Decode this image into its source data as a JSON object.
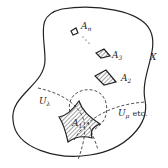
{
  "diagram": {
    "type": "set-diagram",
    "colors": {
      "stroke": "#222222",
      "hatch": "#444444",
      "background": "#ffffff"
    },
    "labels": {
      "space": {
        "base": "X",
        "sub": ""
      },
      "sets": [
        {
          "base": "A",
          "sub": "n"
        },
        {
          "base": "A",
          "sub": "3"
        },
        {
          "base": "A",
          "sub": "2"
        },
        {
          "base": "A",
          "sub": "1"
        }
      ],
      "neighborhoods": [
        {
          "base": "U",
          "sub": "λ"
        },
        {
          "base": "U",
          "sub": "μ"
        }
      ],
      "etc_text": "etc.",
      "ellipsis": "⋯"
    }
  }
}
